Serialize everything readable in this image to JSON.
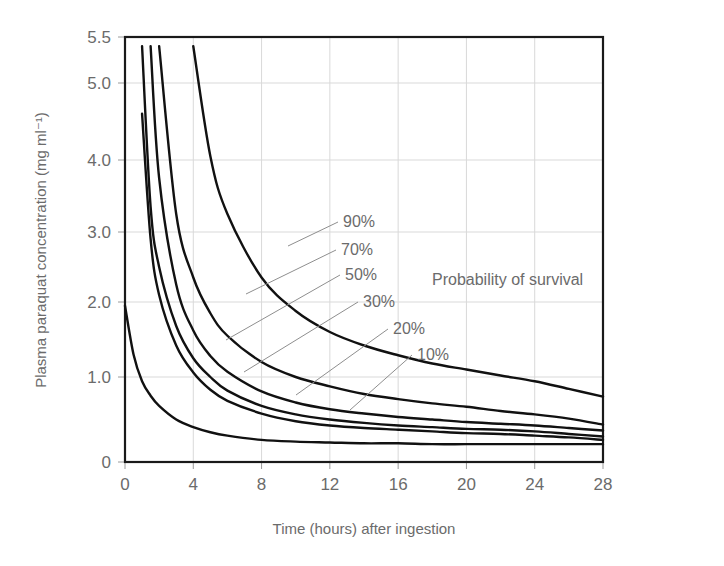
{
  "chart_data": {
    "type": "line",
    "title": "",
    "xlabel": "Time (hours) after ingestion",
    "ylabel": "Plasma paraquat concentration (mg ml⁻¹)",
    "xlim": [
      0,
      28
    ],
    "ylim": [
      0,
      5.5
    ],
    "xticks": [
      "0",
      "4",
      "8",
      "12",
      "16",
      "20",
      "24",
      "28"
    ],
    "xtick_values": [
      0,
      4,
      8,
      12,
      16,
      20,
      24,
      28
    ],
    "yticks": [
      "0",
      "1.0",
      "2.0",
      "3.0",
      "4.0",
      "5.0",
      "5.5"
    ],
    "ytick_values": [
      0,
      1.0,
      2.0,
      3.0,
      4.0,
      5.0,
      5.5
    ],
    "grid": true,
    "legend_position": "inline-labels",
    "annotation": "Probability of survival",
    "x": [
      0,
      0.5,
      1,
      1.5,
      2,
      3,
      4,
      5,
      6,
      8,
      10,
      12,
      14,
      16,
      18,
      20,
      22,
      24,
      26,
      28
    ],
    "series": [
      {
        "name": "90%",
        "label": "90%",
        "values": [
          null,
          null,
          null,
          null,
          null,
          null,
          5.4,
          4.05,
          3.25,
          2.35,
          1.88,
          1.6,
          1.42,
          1.29,
          1.18,
          1.1,
          1.02,
          0.95,
          0.86,
          0.77
        ]
      },
      {
        "name": "70%",
        "label": "70%",
        "values": [
          null,
          null,
          null,
          null,
          5.4,
          3.25,
          2.35,
          1.85,
          1.55,
          1.2,
          1.0,
          0.89,
          0.8,
          0.74,
          0.69,
          0.65,
          0.6,
          0.56,
          0.51,
          0.44
        ]
      },
      {
        "name": "50%",
        "label": "50%",
        "values": [
          null,
          null,
          null,
          5.4,
          3.75,
          2.25,
          1.62,
          1.28,
          1.07,
          0.83,
          0.7,
          0.62,
          0.57,
          0.53,
          0.5,
          0.47,
          0.45,
          0.43,
          0.4,
          0.37
        ]
      },
      {
        "name": "30%",
        "label": "30%",
        "values": [
          null,
          null,
          5.4,
          3.35,
          2.5,
          1.68,
          1.25,
          1.0,
          0.84,
          0.66,
          0.56,
          0.5,
          0.46,
          0.43,
          0.41,
          0.39,
          0.38,
          0.36,
          0.33,
          0.3
        ]
      },
      {
        "name": "20%",
        "label": "20%",
        "values": [
          null,
          null,
          4.6,
          2.9,
          2.1,
          1.42,
          1.06,
          0.85,
          0.72,
          0.57,
          0.48,
          0.43,
          0.4,
          0.38,
          0.36,
          0.34,
          0.33,
          0.31,
          0.29,
          0.26
        ]
      },
      {
        "name": "10%",
        "label": "10%",
        "values": [
          1.95,
          1.3,
          0.95,
          0.78,
          0.66,
          0.5,
          0.41,
          0.35,
          0.31,
          0.26,
          0.24,
          0.23,
          0.22,
          0.22,
          0.21,
          0.21,
          0.21,
          0.21,
          0.21,
          0.21
        ]
      }
    ],
    "curve_labels": [
      {
        "text": "90%",
        "x": 343,
        "y": 227
      },
      {
        "text": "70%",
        "x": 341,
        "y": 255
      },
      {
        "text": "50%",
        "x": 345,
        "y": 280
      },
      {
        "text": "30%",
        "x": 363,
        "y": 307
      },
      {
        "text": "20%",
        "x": 393,
        "y": 334
      },
      {
        "text": "10%",
        "x": 417,
        "y": 360
      }
    ]
  },
  "figure": {
    "annotation_label": "Probability of survival",
    "x_axis_title": "Time (hours) after ingestion",
    "y_axis_title": "Plasma paraquat concentration (mg ml⁻¹)"
  },
  "colors": {
    "curve": "#111111",
    "grid": "#d9d9d9",
    "border": "#1a1a1a",
    "text": "#6b6b6b",
    "background": "#ffffff"
  }
}
